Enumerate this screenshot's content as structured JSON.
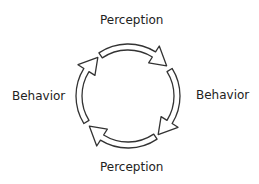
{
  "diagram": {
    "labels": {
      "top": "Perception",
      "right": "Behavior",
      "bottom": "Perception",
      "left": "Behavior"
    },
    "cycle_direction": "clockwise",
    "center": [
      128,
      96
    ],
    "outer_radius": 52,
    "inner_radius": 46,
    "arrow_stroke": "#333333",
    "arrow_fill": "#ffffff",
    "arrows": [
      {
        "name": "top-arrow",
        "start_deg": 236,
        "end_deg": 302,
        "tip_deg": 322
      },
      {
        "name": "right-arrow",
        "start_deg": 328,
        "end_deg": 32,
        "tip_deg": 52
      },
      {
        "name": "bottom-arrow",
        "start_deg": 56,
        "end_deg": 122,
        "tip_deg": 142
      },
      {
        "name": "left-arrow",
        "start_deg": 148,
        "end_deg": 212,
        "tip_deg": 232
      }
    ]
  }
}
